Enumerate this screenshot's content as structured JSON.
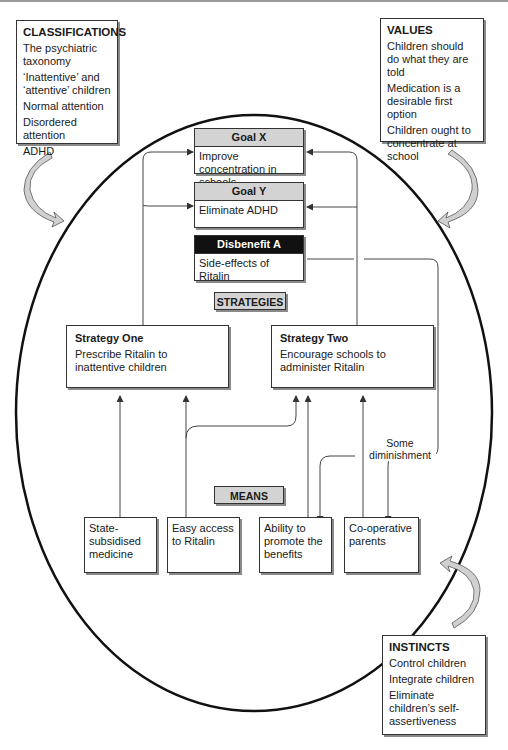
{
  "classifications": {
    "title": "CLASSIFICATIONS",
    "items": [
      "The psychiatric taxonomy",
      "‘Inattentive’ and ‘attentive’ children",
      "Normal attention",
      "Disordered attention",
      "ADHD"
    ]
  },
  "values": {
    "title": "VALUES",
    "items": [
      "Children should do what they are told",
      "Medication is a desirable first option",
      "Children ought to concentrate at school"
    ]
  },
  "instincts": {
    "title": "INSTINCTS",
    "items": [
      "Control children",
      "Integrate children",
      "Eliminate children’s self-assertiveness"
    ]
  },
  "goals": {
    "goal_x": {
      "title": "Goal X",
      "text": "Improve concentration in schools"
    },
    "goal_y": {
      "title": "Goal Y",
      "text": "Eliminate ADHD"
    },
    "disbenefit_a": {
      "title": "Disbenefit A",
      "text": "Side-effects of Ritalin"
    }
  },
  "section_labels": {
    "strategies": "STRATEGIES",
    "means": "MEANS"
  },
  "strategies": {
    "one": {
      "title": "Strategy One",
      "text": "Prescribe Ritalin to inattentive children"
    },
    "two": {
      "title": "Strategy Two",
      "text": "Encourage schools to administer Ritalin"
    }
  },
  "means": [
    {
      "text": "State-subsidised medicine"
    },
    {
      "text": "Easy access to Ritalin"
    },
    {
      "text": "Ability to promote the benefits"
    },
    {
      "text": "Co-operative parents"
    }
  ],
  "annotations": {
    "diminishment": "Some diminishment"
  },
  "colors": {
    "header_gray": "#d3d3d3",
    "disbenefit_black": "#111111",
    "line": "#333333",
    "shadow": "#8a8a8a"
  }
}
